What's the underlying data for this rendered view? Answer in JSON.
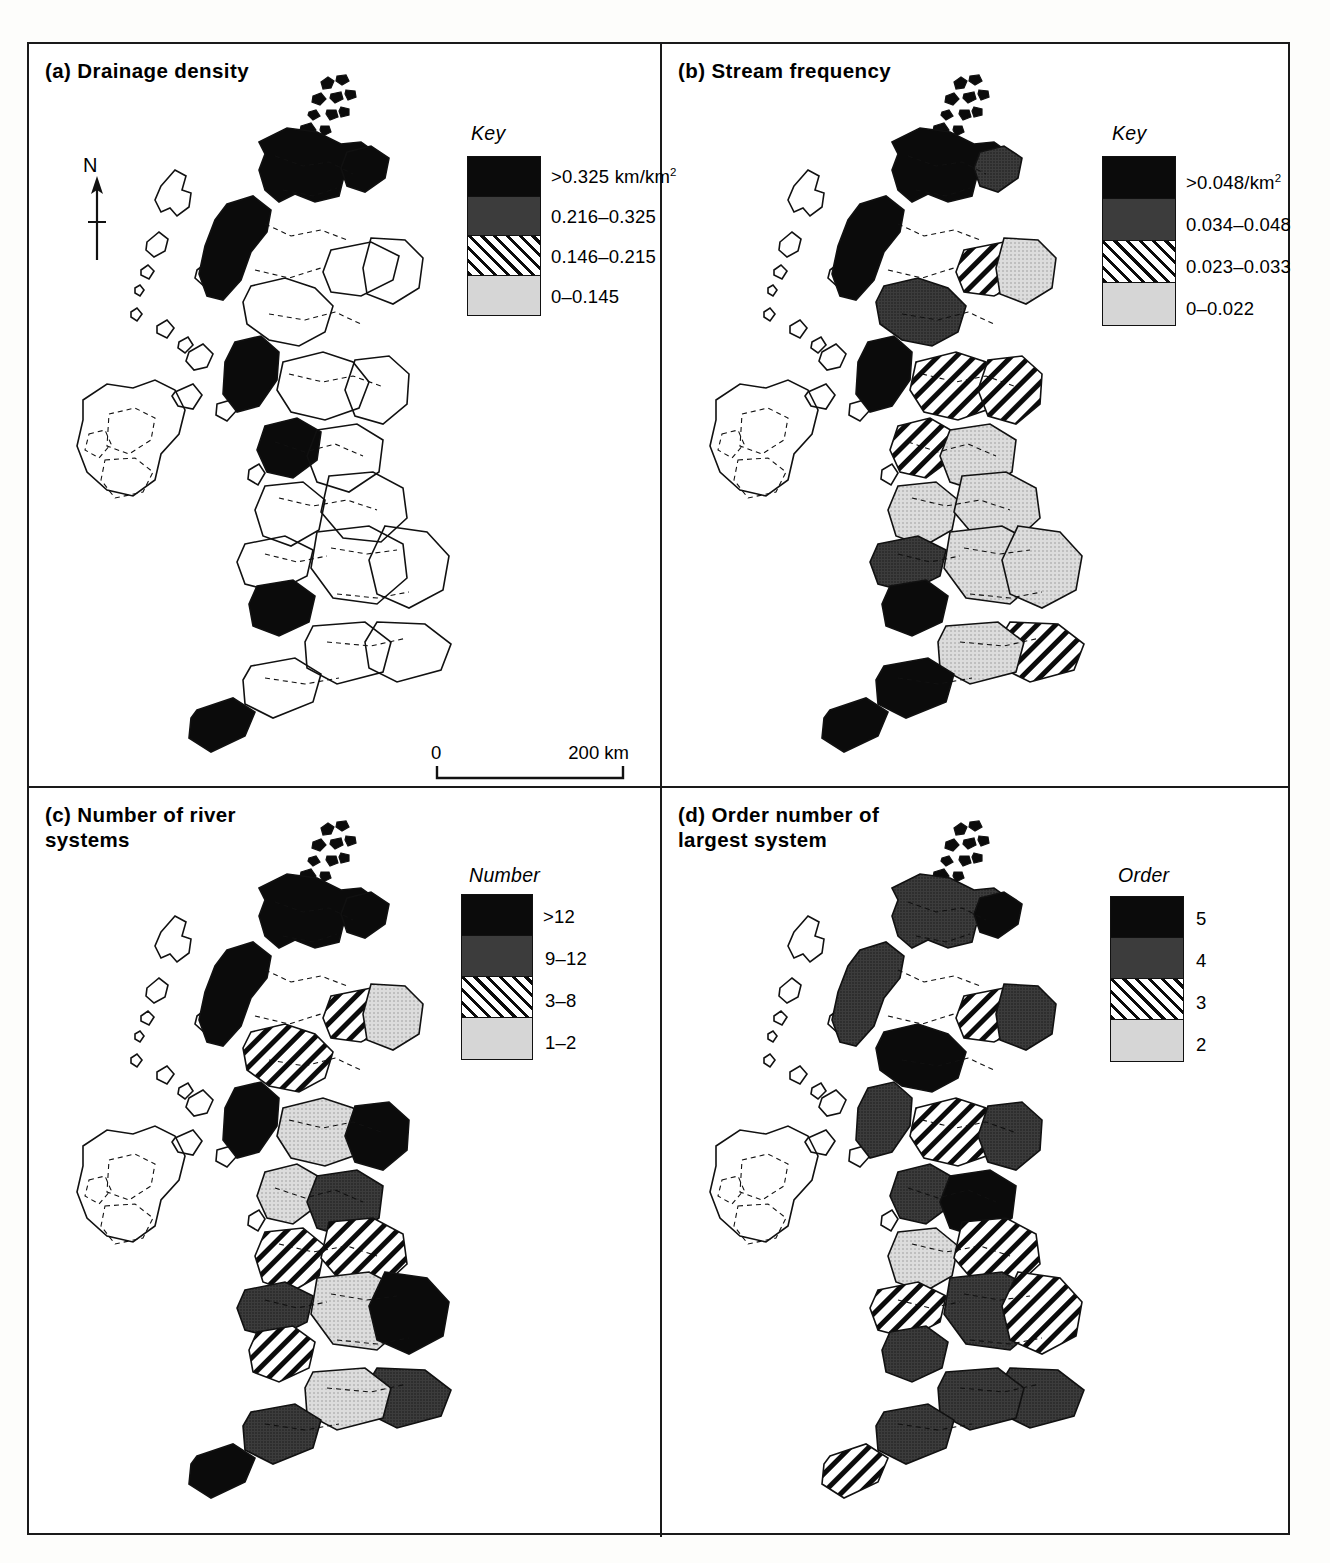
{
  "figure": {
    "background": "#ffffff",
    "ink": "#111111",
    "scale_bar": {
      "left_label": "0",
      "right_label": "200 km"
    },
    "north_arrow": {
      "label": "N"
    }
  },
  "classes": {
    "black": "#0b0b0b",
    "dark_grey": "#3c3c3c",
    "hatched": "#ffffff",
    "light_grey": "#d6d6d6"
  },
  "panels": [
    {
      "id": "a",
      "title": "(a) Drainage density",
      "key_heading": "Key",
      "legend": [
        {
          "fill": "black",
          "label": ">0.325 km/km",
          "sup": "2"
        },
        {
          "fill": "dark",
          "label": "0.216–0.325",
          "sup": ""
        },
        {
          "fill": "hatch",
          "label": "0.146–0.215",
          "sup": ""
        },
        {
          "fill": "light",
          "label": "0–0.145",
          "sup": ""
        }
      ],
      "has_north_arrow": true,
      "has_scale_bar": true
    },
    {
      "id": "b",
      "title": "(b) Stream frequency",
      "key_heading": "Key",
      "legend": [
        {
          "fill": "black",
          "label": ">0.048/km",
          "sup": "2"
        },
        {
          "fill": "dark",
          "label": "0.034–0.048",
          "sup": ""
        },
        {
          "fill": "hatch",
          "label": "0.023–0.033",
          "sup": ""
        },
        {
          "fill": "light",
          "label": "0–0.022",
          "sup": ""
        }
      ],
      "has_north_arrow": false,
      "has_scale_bar": false
    },
    {
      "id": "c",
      "title": "(c) Number of river\n      systems",
      "key_heading": "Number",
      "legend": [
        {
          "fill": "black",
          "label": ">12",
          "sup": ""
        },
        {
          "fill": "dark",
          "label": "9–12",
          "sup": ""
        },
        {
          "fill": "hatch",
          "label": "3–8",
          "sup": ""
        },
        {
          "fill": "light",
          "label": "1–2",
          "sup": ""
        }
      ],
      "has_north_arrow": false,
      "has_scale_bar": false
    },
    {
      "id": "d",
      "title": "(d) Order number of\n      largest system",
      "key_heading": "Order",
      "legend": [
        {
          "fill": "black",
          "label": "5",
          "sup": ""
        },
        {
          "fill": "dark",
          "label": "4",
          "sup": ""
        },
        {
          "fill": "hatch",
          "label": "3",
          "sup": ""
        },
        {
          "fill": "light",
          "label": "2",
          "sup": ""
        }
      ],
      "has_north_arrow": false,
      "has_scale_bar": false
    }
  ],
  "map_regions": {
    "a": {
      "n_scot_hi": "black",
      "ne_scot": "black",
      "w_isles": "black",
      "c_scot": "dark",
      "grampian": "hatch",
      "ne_coast": "light",
      "sw_scot": "black",
      "borders": "hatch",
      "cumbria": "black",
      "pennines": "dark",
      "ne_eng": "dark",
      "lancs": "dark",
      "yorks": "hatch",
      "wales_n": "dark",
      "wales_mid": "black",
      "midlands": "light",
      "e_anglia": "hatch",
      "se_eng": "light",
      "sw_eng": "black",
      "devon": "dark",
      "wessex": "dark"
    },
    "b": {
      "n_scot_hi": "black",
      "ne_scot": "dark",
      "w_isles": "black",
      "c_scot": "dark",
      "grampian": "hatch",
      "ne_coast": "light",
      "sw_scot": "black",
      "borders": "hatch",
      "cumbria": "hatch",
      "pennines": "light",
      "ne_eng": "hatch",
      "lancs": "light",
      "yorks": "light",
      "wales_n": "dark",
      "wales_mid": "black",
      "midlands": "light",
      "e_anglia": "light",
      "se_eng": "hatch",
      "sw_eng": "black",
      "devon": "black",
      "wessex": "light"
    },
    "c": {
      "n_scot_hi": "black",
      "ne_scot": "black",
      "w_isles": "black",
      "c_scot": "hatch",
      "grampian": "hatch",
      "ne_coast": "light",
      "sw_scot": "black",
      "borders": "light",
      "cumbria": "light",
      "pennines": "dark",
      "ne_eng": "black",
      "lancs": "hatch",
      "yorks": "hatch",
      "wales_n": "dark",
      "wales_mid": "hatch",
      "midlands": "light",
      "e_anglia": "black",
      "se_eng": "dark",
      "sw_eng": "black",
      "devon": "dark",
      "wessex": "light"
    },
    "d": {
      "n_scot_hi": "dark",
      "ne_scot": "black",
      "w_isles": "dark",
      "c_scot": "black",
      "grampian": "hatch",
      "ne_coast": "dark",
      "sw_scot": "dark",
      "borders": "hatch",
      "cumbria": "dark",
      "pennines": "black",
      "ne_eng": "dark",
      "lancs": "light",
      "yorks": "hatch",
      "wales_n": "hatch",
      "wales_mid": "dark",
      "midlands": "dark",
      "e_anglia": "hatch",
      "se_eng": "dark",
      "sw_eng": "hatch",
      "devon": "dark",
      "wessex": "dark"
    }
  }
}
